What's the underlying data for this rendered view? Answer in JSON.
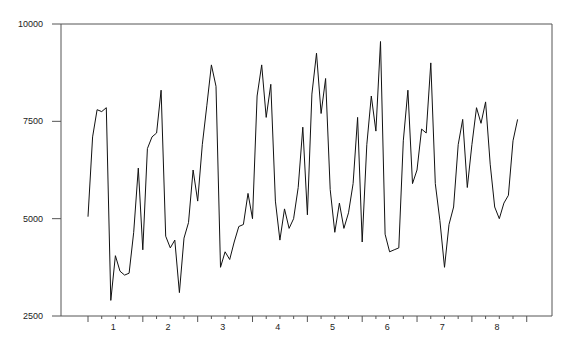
{
  "chart_data": {
    "type": "line",
    "title": "",
    "xlabel": "",
    "ylabel": "",
    "ylim": [
      2500,
      10000
    ],
    "yticks": [
      2500,
      5000,
      7500,
      10000
    ],
    "ytick_labels": [
      "2500",
      "5000",
      "7500",
      "10000"
    ],
    "xtick_labels": [
      "1",
      "2",
      "3",
      "4",
      "5",
      "6",
      "7",
      "8"
    ],
    "grid": false,
    "legend": null,
    "series": [
      {
        "name": "series",
        "color": "#111111",
        "values": [
          5050,
          7100,
          7800,
          7750,
          7850,
          2900,
          4050,
          3650,
          3550,
          3600,
          4650,
          6300,
          4200,
          6800,
          7100,
          7200,
          8300,
          4550,
          4250,
          4450,
          3100,
          4500,
          4900,
          6250,
          5450,
          6900,
          7900,
          8950,
          8400,
          3750,
          4150,
          3950,
          4400,
          4800,
          4850,
          5650,
          5000,
          8150,
          8950,
          7600,
          8450,
          5450,
          4450,
          5250,
          4750,
          5000,
          5800,
          7350,
          5100,
          8200,
          9250,
          7700,
          8600,
          5750,
          4650,
          5400,
          4750,
          5150,
          5900,
          7600,
          4400,
          6900,
          8150,
          7250,
          9550,
          4600,
          4150,
          4200,
          4250,
          7000,
          8300,
          5900,
          6250,
          7300,
          7200,
          9000,
          5900,
          4950,
          3750,
          4850,
          5300,
          6900,
          7550,
          5800,
          6900,
          7850,
          7450,
          8000,
          6400,
          5300,
          5000,
          5400,
          5600,
          7000,
          7550
        ]
      }
    ]
  }
}
